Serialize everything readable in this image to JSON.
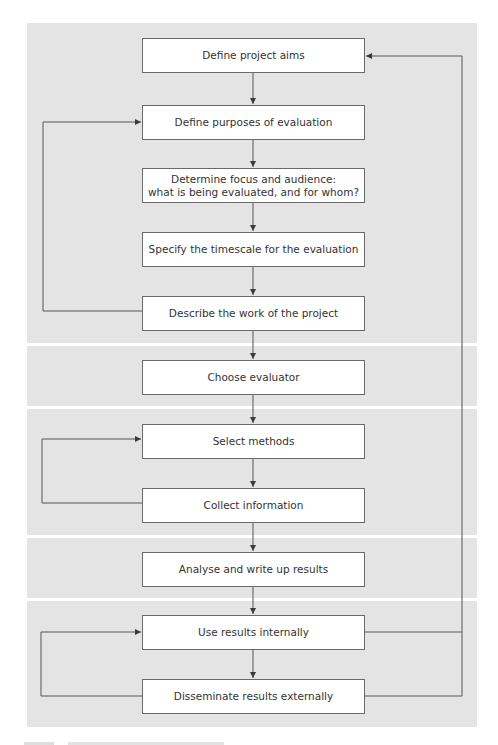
{
  "diagram": {
    "type": "flowchart",
    "colors": {
      "panel_background": "#e4e4e4",
      "band_separator": "#ffffff",
      "box_fill": "#ffffff",
      "box_border": "#6a6a6a",
      "line": "#555555",
      "text": "#333333"
    },
    "bands": [
      {
        "id": "band-1",
        "steps": [
          "step-1",
          "step-2",
          "step-3",
          "step-4",
          "step-5"
        ]
      },
      {
        "id": "band-2",
        "steps": [
          "step-6"
        ]
      },
      {
        "id": "band-3",
        "steps": [
          "step-7",
          "step-8"
        ]
      },
      {
        "id": "band-4",
        "steps": [
          "step-9"
        ]
      },
      {
        "id": "band-5",
        "steps": [
          "step-10",
          "step-11"
        ]
      }
    ],
    "steps": [
      {
        "id": "step-1",
        "label": "Define project aims"
      },
      {
        "id": "step-2",
        "label": "Define purposes of evaluation"
      },
      {
        "id": "step-3",
        "label": "Determine focus and audience:\nwhat is being evaluated, and for whom?"
      },
      {
        "id": "step-4",
        "label": "Specify the timescale for the evaluation"
      },
      {
        "id": "step-5",
        "label": "Describe the work of the project"
      },
      {
        "id": "step-6",
        "label": "Choose evaluator"
      },
      {
        "id": "step-7",
        "label": "Select methods"
      },
      {
        "id": "step-8",
        "label": "Collect information"
      },
      {
        "id": "step-9",
        "label": "Analyse and write up results"
      },
      {
        "id": "step-10",
        "label": "Use results internally"
      },
      {
        "id": "step-11",
        "label": "Disseminate results externally"
      }
    ],
    "edges": [
      {
        "from": "step-1",
        "to": "step-2",
        "kind": "sequence"
      },
      {
        "from": "step-2",
        "to": "step-3",
        "kind": "sequence"
      },
      {
        "from": "step-3",
        "to": "step-4",
        "kind": "sequence"
      },
      {
        "from": "step-4",
        "to": "step-5",
        "kind": "sequence"
      },
      {
        "from": "step-5",
        "to": "step-6",
        "kind": "sequence"
      },
      {
        "from": "step-6",
        "to": "step-7",
        "kind": "sequence"
      },
      {
        "from": "step-7",
        "to": "step-8",
        "kind": "sequence"
      },
      {
        "from": "step-8",
        "to": "step-9",
        "kind": "sequence"
      },
      {
        "from": "step-9",
        "to": "step-10",
        "kind": "sequence"
      },
      {
        "from": "step-10",
        "to": "step-11",
        "kind": "sequence"
      },
      {
        "from": "step-5",
        "to": "step-2",
        "kind": "feedback-left"
      },
      {
        "from": "step-8",
        "to": "step-7",
        "kind": "feedback-left"
      },
      {
        "from": "step-11",
        "to": "step-10",
        "kind": "feedback-left"
      },
      {
        "from": "step-10",
        "to": "step-1",
        "kind": "feedback-right"
      },
      {
        "from": "step-11",
        "to": "step-1",
        "kind": "feedback-right"
      }
    ]
  }
}
